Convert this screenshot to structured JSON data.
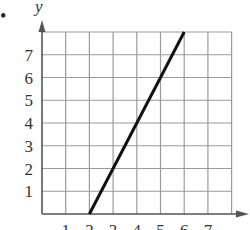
{
  "chart_data": {
    "type": "line",
    "title": "",
    "xlabel": "",
    "ylabel": "y",
    "xlim": [
      0,
      8
    ],
    "ylim": [
      0,
      8
    ],
    "grid": true,
    "x_ticks": [
      "1",
      "2",
      "3",
      "4",
      "5",
      "6",
      "7"
    ],
    "y_ticks": [
      "1",
      "2",
      "3",
      "4",
      "5",
      "6",
      "7"
    ],
    "series": [
      {
        "name": "line",
        "x": [
          2,
          6
        ],
        "y": [
          0,
          8
        ]
      }
    ],
    "marker": "•"
  },
  "colors": {
    "grid": "#9a9a9a",
    "axis": "#555555",
    "line": "#111111",
    "text": "#333333"
  }
}
